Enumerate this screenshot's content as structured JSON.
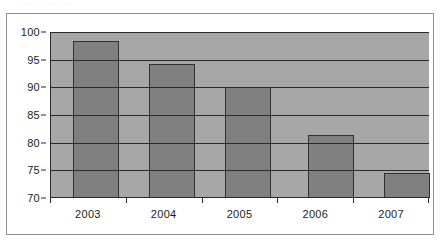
{
  "artifact": {
    "clipped_text": "·  ··   ··   ···  ··"
  },
  "colors": {
    "bar_fill": "#808080",
    "bar_outline": "#303030",
    "plot_background": "#a7a7a7",
    "gridline": "#2b2b2b",
    "frame_border": "#8e8e8e",
    "page_background": "#ffffff",
    "text": "#1c1c1c"
  },
  "chart_data": {
    "type": "bar",
    "title": "",
    "subtitle": "",
    "xlabel": "",
    "ylabel": "",
    "categories": [
      "2003",
      "2004",
      "2005",
      "2006",
      "2007"
    ],
    "values": [
      98.3,
      94.3,
      90.0,
      81.4,
      74.6
    ],
    "series": [
      {
        "name": "",
        "values": [
          98.3,
          94.3,
          90.0,
          81.4,
          74.6
        ]
      }
    ],
    "ylim": [
      70,
      100
    ],
    "yticks": [
      70,
      75,
      80,
      85,
      90,
      95,
      100
    ],
    "ytick_labels": [
      "70",
      "75",
      "80",
      "85",
      "90",
      "95",
      "100"
    ],
    "xtick_labels": [
      "2003",
      "2004",
      "2005",
      "2006",
      "2007"
    ],
    "grid": true,
    "grid_axis": "y",
    "legend": false,
    "legend_position": "none",
    "bar_color": "#808080",
    "annotations": []
  }
}
